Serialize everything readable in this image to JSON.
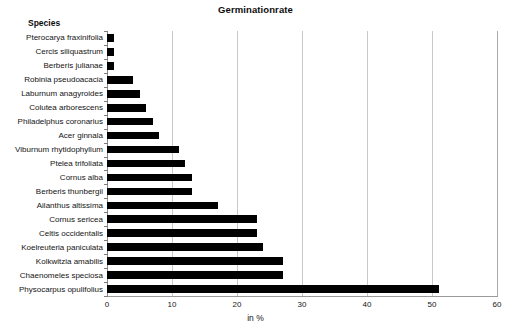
{
  "chart_data": {
    "type": "bar",
    "orientation": "horizontal",
    "title": "Germinationrate",
    "xlabel": "in  %",
    "ylabel": "Species",
    "xlim": [
      0,
      60
    ],
    "xticks": [
      0,
      10,
      20,
      30,
      40,
      50,
      60
    ],
    "grid": true,
    "legend": false,
    "bar_color": "#000000",
    "gridline_color": "#c8c8c8",
    "background_color": "#ffffff",
    "categories": [
      "Pterocarya fraxinifolia",
      "Cercis siliquastrum",
      "Berberis julianae",
      "Robinia pseudoacacia",
      "Laburnum anagyroides",
      "Colutea arborescens",
      "Philadelphus coronarius",
      "Acer ginnala",
      "Viburnum rhytidophyllum",
      "Ptelea trifoliata",
      "Cornus alba",
      "Berberis thunbergii",
      "Ailanthus altissima",
      "Cornus sericea",
      "Celtis occidentalis",
      "Koelreuteria paniculata",
      "Kolkwitzia amabilis",
      "Chaenomeles speciosa",
      "Physocarpus opulifolius"
    ],
    "values": [
      1,
      1,
      1,
      4,
      5,
      6,
      7,
      8,
      11,
      12,
      13,
      13,
      17,
      23,
      23,
      24,
      27,
      27,
      51
    ]
  }
}
